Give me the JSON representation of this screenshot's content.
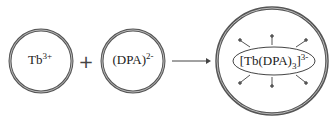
{
  "diagram": {
    "reactant1": {
      "base": "Tb",
      "charge": "3+"
    },
    "operator": "+",
    "reactant2": {
      "base": "(DPA)",
      "charge": "2-"
    },
    "product": {
      "prefix": "[Tb(DPA)",
      "subscript": "3",
      "suffix": "]",
      "charge": "3-"
    },
    "arrow": "reaction-arrow",
    "emission_rays": 6
  }
}
